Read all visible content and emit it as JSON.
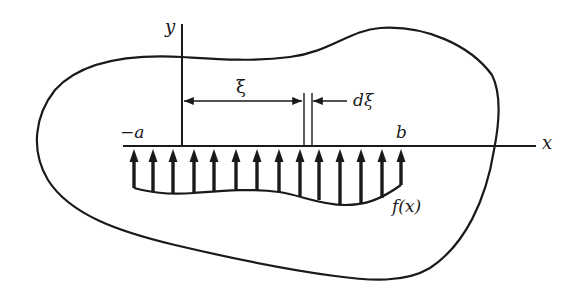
{
  "figure": {
    "colors": {
      "ink": "#1a1a1a",
      "background": "#ffffff"
    }
  },
  "labels": {
    "y_axis": "y",
    "x_axis": "x",
    "left_limit": "−a",
    "right_limit": "b",
    "xi": "ξ",
    "dxi": "dξ",
    "load_function": "f(x)"
  },
  "geometry": {
    "x_axis": {
      "y": 146,
      "x_start": 123,
      "x_end": 536
    },
    "y_axis": {
      "x": 182,
      "y_start": 24,
      "y_end": 146
    },
    "xi_dimension": {
      "y": 101,
      "x_start": 183,
      "x_end": 303
    },
    "dxi_strip": {
      "x_left": 304,
      "x_right": 312,
      "y_top": 93,
      "y_bottom": 146
    },
    "load_arrows": {
      "x": [
        134,
        153,
        173,
        194,
        214,
        236,
        257,
        279,
        300,
        319,
        340,
        361,
        382,
        401
      ],
      "bottom_y": [
        188,
        192,
        194,
        193,
        191,
        190,
        190,
        192,
        196,
        200,
        204,
        204,
        198,
        185
      ]
    }
  }
}
